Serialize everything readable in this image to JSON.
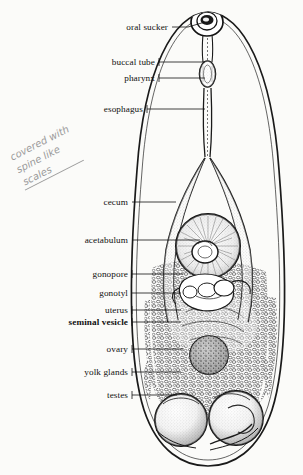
{
  "figure": {
    "organism_outline_color": "#1a1a1a",
    "background_color": "#fbfbf9",
    "label_color": "#101010",
    "handwriting_color": "#9a9a9a"
  },
  "labels": [
    {
      "id": "oral-sucker",
      "text": "oral sucker",
      "bold": false,
      "x": 168,
      "y": 30,
      "leader_to_x": 205,
      "leader_to_y": 22
    },
    {
      "id": "buccal-tube",
      "text": "buccal tube",
      "bold": false,
      "x": 155,
      "y": 65,
      "leader_to_x": 205,
      "leader_to_y": 63
    },
    {
      "id": "pharynx",
      "text": "pharynx",
      "bold": false,
      "x": 155,
      "y": 81,
      "leader_to_x": 205,
      "leader_to_y": 78
    },
    {
      "id": "esophagus",
      "text": "esophagus",
      "bold": false,
      "x": 143,
      "y": 112,
      "leader_to_x": 205,
      "leader_to_y": 110
    },
    {
      "id": "cecum",
      "text": "cecum",
      "bold": false,
      "x": 128,
      "y": 205,
      "leader_to_x": 175,
      "leader_to_y": 203
    },
    {
      "id": "acetabulum",
      "text": "acetabulum",
      "bold": false,
      "x": 128,
      "y": 243,
      "leader_to_x": 200,
      "leader_to_y": 243
    },
    {
      "id": "gonopore",
      "text": "gonopore",
      "bold": false,
      "x": 128,
      "y": 277,
      "leader_to_x": 182,
      "leader_to_y": 277
    },
    {
      "id": "gonotyl",
      "text": "gonotyl",
      "bold": false,
      "x": 128,
      "y": 296,
      "leader_to_x": 180,
      "leader_to_y": 296
    },
    {
      "id": "uterus",
      "text": "uterus",
      "bold": false,
      "x": 128,
      "y": 313,
      "leader_to_x": 180,
      "leader_to_y": 313
    },
    {
      "id": "seminal-vesicle",
      "text": "seminal vesicle",
      "bold": true,
      "x": 128,
      "y": 325,
      "leader_to_x": 180,
      "leader_to_y": 325
    },
    {
      "id": "ovary",
      "text": "ovary",
      "bold": false,
      "x": 128,
      "y": 352,
      "leader_to_x": 182,
      "leader_to_y": 352
    },
    {
      "id": "yolk-glands",
      "text": "yolk glands",
      "bold": false,
      "x": 128,
      "y": 375,
      "leader_to_x": 180,
      "leader_to_y": 375
    },
    {
      "id": "testes",
      "text": "testes",
      "bold": false,
      "x": 128,
      "y": 398,
      "leader_to_x": 176,
      "leader_to_y": 398
    }
  ],
  "annotation": {
    "line1": "covered with",
    "line2": "spine like",
    "line3": "scales"
  }
}
